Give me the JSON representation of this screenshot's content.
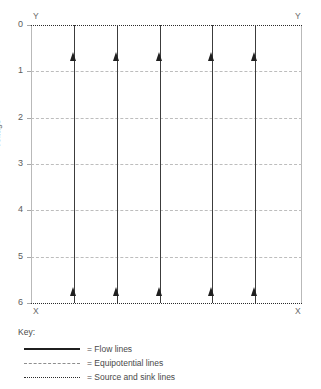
{
  "chart_data": {
    "type": "line",
    "title": "",
    "xlabel": "X",
    "ylabel": "Voltage",
    "ylim": [
      0,
      6
    ],
    "grid": true,
    "legend_position": "bottom-left",
    "axis_corner_labels": {
      "top_left": "Y",
      "top_right": "Y",
      "bottom_left": "X",
      "bottom_right": "X"
    },
    "y_ticks": [
      {
        "label": "0",
        "value": 0
      },
      {
        "label": "1",
        "value": 1
      },
      {
        "label": "2",
        "value": 2
      },
      {
        "label": "3",
        "value": 3
      },
      {
        "label": "4",
        "value": 4
      },
      {
        "label": "5",
        "value": 5
      },
      {
        "label": "6",
        "value": 6
      }
    ],
    "equipotential_lines": [
      {
        "voltage": 1
      },
      {
        "voltage": 2
      },
      {
        "voltage": 3
      },
      {
        "voltage": 4
      },
      {
        "voltage": 5
      }
    ],
    "source_sink_lines": [
      {
        "voltage": 0,
        "role": "source"
      },
      {
        "voltage": 6,
        "role": "sink"
      }
    ],
    "flow_lines": [
      {
        "x_px": 43,
        "direction": "up"
      },
      {
        "x_px": 86,
        "direction": "up"
      },
      {
        "x_px": 129,
        "direction": "up"
      },
      {
        "x_px": 181,
        "direction": "up"
      },
      {
        "x_px": 224,
        "direction": "up"
      }
    ],
    "arrow_rows_px": [
      27,
      262
    ]
  },
  "legend": {
    "title": "Key:",
    "entries": [
      {
        "style": "solid",
        "label": "= Flow lines"
      },
      {
        "style": "dashed",
        "label": "= Equipotential lines"
      },
      {
        "style": "dotted",
        "label": "= Source and sink lines"
      }
    ]
  }
}
